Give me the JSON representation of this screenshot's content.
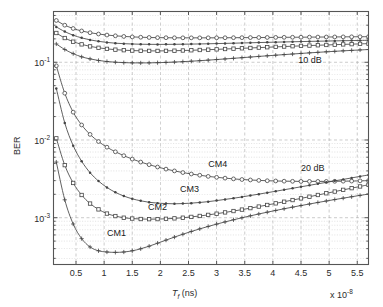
{
  "figure": {
    "background": "#ffffff",
    "axis_color": "#555555",
    "grid_color": "#aaaaaa",
    "curve_color": "#444444"
  },
  "axes": {
    "xlabel_main": "T",
    "xlabel_sub": "f",
    "xlabel_unit": " (ns)",
    "xlabel_full": "T_f (ns)",
    "ylabel": "BER",
    "x_multiplier_prefix": "x 10",
    "x_multiplier_exp": "-8",
    "x_multiplier_full": "x 10^-8",
    "xticks": [
      "0.5",
      "1",
      "1.5",
      "2",
      "2.5",
      "3",
      "3.5",
      "4",
      "4.5",
      "5",
      "5.5"
    ],
    "xtick_values": [
      0.5,
      1,
      1.5,
      2,
      2.5,
      3,
      3.5,
      4,
      4.5,
      5,
      5.5
    ],
    "xlim": [
      0.1,
      5.7
    ],
    "yticks": [
      "10^-1",
      "10^-2",
      "10^-3"
    ],
    "ytick_mantissa": "10",
    "ytick_exponents": [
      "-1",
      "-2",
      "-3"
    ],
    "ytick_values": [
      0.1,
      0.01,
      0.001
    ],
    "ylim": [
      0.00025,
      0.45
    ],
    "grid": "on",
    "yscale": "log",
    "xscale": "linear"
  },
  "annotations": [
    {
      "text": "10 dB",
      "x": 4.45,
      "y": 0.105,
      "name": "annotation-10db"
    },
    {
      "text": "20 dB",
      "x": 4.5,
      "y": 0.0042,
      "name": "annotation-20db"
    },
    {
      "text": "CM4",
      "x": 2.85,
      "y": 0.0048,
      "name": "annotation-cm4"
    },
    {
      "text": "CM3",
      "x": 2.35,
      "y": 0.00225,
      "name": "annotation-cm3"
    },
    {
      "text": "CM2",
      "x": 1.78,
      "y": 0.00132,
      "name": "annotation-cm2"
    },
    {
      "text": "CM1",
      "x": 1.05,
      "y": 0.00062,
      "name": "annotation-cm1"
    }
  ],
  "chart_data": {
    "type": "line",
    "title": "",
    "xlabel": "T_f (ns)",
    "ylabel": "BER",
    "xscale": "linear",
    "yscale": "log",
    "xlim": [
      0.1,
      5.7
    ],
    "ylim": [
      0.00025,
      0.45
    ],
    "x_multiplier": "1e-8",
    "grid": true,
    "legend_position": "inline-annotations",
    "x": [
      0.15,
      0.3,
      0.45,
      0.6,
      0.75,
      0.9,
      1.05,
      1.2,
      1.35,
      1.5,
      1.65,
      1.8,
      1.95,
      2.1,
      2.25,
      2.4,
      2.55,
      2.7,
      2.85,
      3.0,
      3.15,
      3.3,
      3.45,
      3.6,
      3.75,
      3.9,
      4.05,
      4.2,
      4.35,
      4.5,
      4.65,
      4.8,
      4.95,
      5.1,
      5.25,
      5.4,
      5.55,
      5.7
    ],
    "series": [
      {
        "name": "CM4 10 dB",
        "group": "10 dB",
        "marker": "circle",
        "values": [
          0.345,
          0.3,
          0.272,
          0.253,
          0.24,
          0.231,
          0.224,
          0.219,
          0.215,
          0.212,
          0.21,
          0.2085,
          0.2075,
          0.207,
          0.2065,
          0.2063,
          0.2062,
          0.2062,
          0.2063,
          0.2065,
          0.2068,
          0.2071,
          0.2074,
          0.2078,
          0.2082,
          0.2086,
          0.209,
          0.2094,
          0.2098,
          0.2102,
          0.2106,
          0.211,
          0.2114,
          0.2118,
          0.2122,
          0.2126,
          0.213,
          0.2134
        ]
      },
      {
        "name": "CM3 10 dB",
        "group": "10 dB",
        "marker": "dot",
        "values": [
          0.285,
          0.248,
          0.223,
          0.206,
          0.194,
          0.186,
          0.18,
          0.176,
          0.1735,
          0.1718,
          0.1707,
          0.1701,
          0.1699,
          0.17,
          0.1703,
          0.1708,
          0.1714,
          0.1721,
          0.173,
          0.174,
          0.175,
          0.176,
          0.1771,
          0.1782,
          0.1793,
          0.1804,
          0.1815,
          0.1826,
          0.1836,
          0.1846,
          0.1856,
          0.1866,
          0.1875,
          0.1884,
          0.1893,
          0.1901,
          0.1909,
          0.1917
        ]
      },
      {
        "name": "CM2 10 dB",
        "group": "10 dB",
        "marker": "square",
        "values": [
          0.238,
          0.205,
          0.184,
          0.17,
          0.16,
          0.1535,
          0.1487,
          0.1453,
          0.143,
          0.1414,
          0.1405,
          0.1401,
          0.14,
          0.1403,
          0.1409,
          0.1417,
          0.1427,
          0.1439,
          0.1452,
          0.1466,
          0.1481,
          0.1496,
          0.1512,
          0.1528,
          0.1544,
          0.1561,
          0.1577,
          0.1593,
          0.1609,
          0.1625,
          0.164,
          0.1655,
          0.167,
          0.1684,
          0.1698,
          0.1711,
          0.1724,
          0.1737
        ]
      },
      {
        "name": "CM1 10 dB",
        "group": "10 dB",
        "marker": "plus",
        "values": [
          0.172,
          0.146,
          0.129,
          0.1175,
          0.1105,
          0.1055,
          0.1022,
          0.1001,
          0.0989,
          0.0983,
          0.0981,
          0.0983,
          0.0988,
          0.0996,
          0.1006,
          0.1018,
          0.1032,
          0.1048,
          0.1065,
          0.1084,
          0.1104,
          0.1124,
          0.1145,
          0.1167,
          0.1189,
          0.1211,
          0.1233,
          0.1255,
          0.1277,
          0.1299,
          0.1321,
          0.1342,
          0.1363,
          0.1383,
          0.1403,
          0.1422,
          0.1441,
          0.1459
        ]
      },
      {
        "name": "CM4 20 dB",
        "group": "20 dB",
        "marker": "circle",
        "values": [
          0.09,
          0.04,
          0.0228,
          0.0156,
          0.0118,
          0.00955,
          0.00808,
          0.00705,
          0.00628,
          0.00568,
          0.0052,
          0.00481,
          0.00449,
          0.00422,
          0.004,
          0.00381,
          0.00365,
          0.00352,
          0.0034,
          0.00331,
          0.00323,
          0.00316,
          0.0031,
          0.00306,
          0.00302,
          0.00299,
          0.00297,
          0.00295,
          0.00294,
          0.00293,
          0.00293,
          0.00293,
          0.00293,
          0.00294,
          0.00295,
          0.00296,
          0.00298,
          0.003
        ]
      },
      {
        "name": "CM3 20 dB",
        "group": "20 dB",
        "marker": "dot",
        "values": [
          0.046,
          0.0166,
          0.00845,
          0.00533,
          0.0038,
          0.00296,
          0.00245,
          0.00212,
          0.0019,
          0.00175,
          0.00165,
          0.00158,
          0.00154,
          0.00152,
          0.00151,
          0.00152,
          0.00154,
          0.00157,
          0.00161,
          0.00166,
          0.00172,
          0.00178,
          0.00185,
          0.00193,
          0.00201,
          0.0021,
          0.00219,
          0.00229,
          0.00239,
          0.0025,
          0.00261,
          0.00273,
          0.00285,
          0.00298,
          0.00311,
          0.00325,
          0.0034,
          0.00355
        ]
      },
      {
        "name": "CM2 20 dB",
        "group": "20 dB",
        "marker": "square",
        "values": [
          0.0105,
          0.00475,
          0.0028,
          0.00196,
          0.00152,
          0.00128,
          0.00113,
          0.00105,
          0.001,
          0.000975,
          0.000962,
          0.000958,
          0.00096,
          0.000968,
          0.000981,
          0.001,
          0.001024,
          0.001053,
          0.001087,
          0.001126,
          0.00117,
          0.001218,
          0.001271,
          0.001329,
          0.001391,
          0.001458,
          0.00153,
          0.001606,
          0.001687,
          0.001773,
          0.001864,
          0.00196,
          0.002062,
          0.002169,
          0.002282,
          0.0024,
          0.002524,
          0.002655
        ]
      },
      {
        "name": "CM1 20 dB",
        "group": "20 dB",
        "marker": "plus",
        "values": [
          0.0052,
          0.0017,
          0.00083,
          0.000538,
          0.00042,
          0.000375,
          0.000362,
          0.000358,
          0.000362,
          0.000375,
          0.000398,
          0.00043,
          0.00047,
          0.000515,
          0.000563,
          0.000613,
          0.000665,
          0.000718,
          0.000772,
          0.000827,
          0.000883,
          0.00094,
          0.000998,
          0.001057,
          0.001117,
          0.001178,
          0.00124,
          0.001303,
          0.001368,
          0.001434,
          0.001501,
          0.00157,
          0.00164,
          0.001712,
          0.001785,
          0.00186,
          0.001937,
          0.002015
        ]
      }
    ]
  }
}
